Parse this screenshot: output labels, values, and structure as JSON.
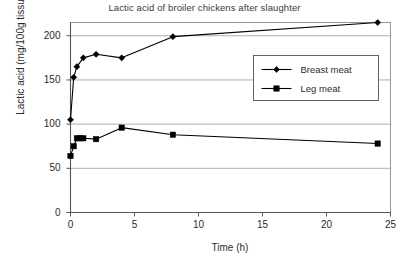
{
  "chart_data": {
    "type": "line",
    "title": "Lactic acid of broiler chickens after slaughter",
    "xlabel": "Time (h)",
    "ylabel": "Lactic acid (mg/100g tissue)",
    "xlim": [
      0,
      25
    ],
    "ylim": [
      0,
      215
    ],
    "xticks": [
      0,
      5,
      10,
      15,
      20,
      25
    ],
    "yticks": [
      0,
      50,
      100,
      150,
      200
    ],
    "xtick_labels": [
      "0",
      "5",
      "10",
      "15",
      "20",
      "25"
    ],
    "ytick_labels": [
      "0",
      "50",
      "100",
      "150",
      "200"
    ],
    "grid": "horizontal",
    "legend_position": "inside upper-right",
    "series": [
      {
        "name": "Breast meat",
        "marker": "diamond",
        "color": "#000000",
        "points": [
          {
            "x": 0,
            "y": 105
          },
          {
            "x": 0.25,
            "y": 153
          },
          {
            "x": 0.5,
            "y": 165
          },
          {
            "x": 1,
            "y": 175
          },
          {
            "x": 2,
            "y": 179
          },
          {
            "x": 4,
            "y": 175
          },
          {
            "x": 8,
            "y": 199
          },
          {
            "x": 24,
            "y": 215
          }
        ]
      },
      {
        "name": "Leg meat",
        "marker": "square",
        "color": "#000000",
        "points": [
          {
            "x": 0,
            "y": 64
          },
          {
            "x": 0.25,
            "y": 75
          },
          {
            "x": 0.5,
            "y": 84
          },
          {
            "x": 0.75,
            "y": 84
          },
          {
            "x": 1,
            "y": 84
          },
          {
            "x": 2,
            "y": 83
          },
          {
            "x": 4,
            "y": 96
          },
          {
            "x": 8,
            "y": 88
          },
          {
            "x": 24,
            "y": 78
          }
        ]
      }
    ]
  },
  "legend": {
    "entries": [
      {
        "label": "Breast meat"
      },
      {
        "label": "Leg meat"
      }
    ]
  }
}
